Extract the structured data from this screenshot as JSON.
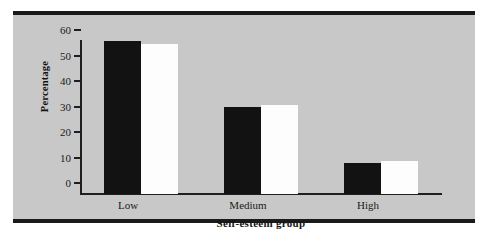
{
  "chart_data": {
    "type": "bar",
    "title": "",
    "xlabel": "Self-esteem group",
    "ylabel": "Percentage",
    "categories": [
      "Low",
      "Medium",
      "High"
    ],
    "ylim": [
      0,
      60
    ],
    "yticks": [
      0,
      10,
      20,
      30,
      40,
      50,
      60
    ],
    "ytick_labels": [
      "0",
      "10",
      "20",
      "30",
      "40",
      "50",
      "60"
    ],
    "grid": false,
    "legend": "none",
    "series": [
      {
        "name": "series-1",
        "color": "#121212",
        "values": [
          60,
          34,
          12
        ]
      },
      {
        "name": "series-2",
        "color": "#fdfdfd",
        "values": [
          59,
          35,
          13
        ]
      }
    ]
  }
}
